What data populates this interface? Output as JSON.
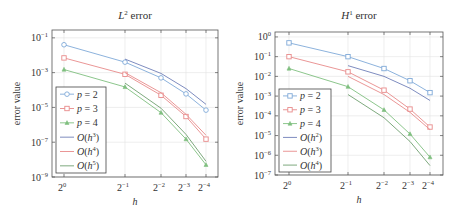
{
  "chart_data": [
    {
      "type": "line",
      "title": "L² error",
      "title_main": "L",
      "title_sup": "2",
      "title_rest": " error",
      "xlabel": "h",
      "ylabel": "error value",
      "xscale": "log2",
      "yscale": "log10",
      "x": [
        1,
        0.5,
        0.25,
        0.125,
        0.0625
      ],
      "x_tick_labels": [
        "2^0",
        "2^-1",
        "2^-2",
        "2^-3",
        "2^-4"
      ],
      "x_tick_exps": [
        "0",
        "−1",
        "−2",
        "−3",
        "−4"
      ],
      "y_tick_exps": [
        "−1",
        "−3",
        "−5",
        "−7",
        "−9"
      ],
      "y_ticks": [
        -1,
        -3,
        -5,
        -7,
        -9
      ],
      "ylim_log10": [
        -9,
        -0.55
      ],
      "grid": true,
      "legend_position": "lower left",
      "series": [
        {
          "name": "p = 2",
          "key": "p",
          "num": "2",
          "color": "#7fa9d8",
          "marker": "circle",
          "x": [
            1,
            0.5,
            0.25,
            0.125,
            0.0625
          ],
          "values": [
            0.04,
            0.004,
            0.0005,
            6e-05,
            7e-06
          ]
        },
        {
          "name": "p = 3",
          "key": "p",
          "num": "3",
          "color": "#e88a8a",
          "marker": "square",
          "x": [
            1,
            0.5,
            0.25,
            0.125,
            0.0625
          ],
          "values": [
            0.007,
            0.0008,
            5e-05,
            3e-06,
            1.5e-07
          ]
        },
        {
          "name": "p = 4",
          "key": "p",
          "num": "4",
          "color": "#7fbf7f",
          "marker": "triangle",
          "x": [
            1,
            0.5,
            0.25,
            0.125,
            0.0625
          ],
          "values": [
            0.0015,
            0.00015,
            5e-06,
            1.5e-07,
            5e-09
          ]
        },
        {
          "name": "O(h^3)",
          "key": "O",
          "num": "3",
          "color": "#6f7fb8",
          "marker": "none",
          "x": [
            0.5,
            0.25,
            0.125,
            0.0625
          ],
          "values": [
            0.006,
            0.0009,
            0.00012,
            1.5e-05
          ]
        },
        {
          "name": "O(h^4)",
          "key": "O",
          "num": "4",
          "color": "#e88a8a",
          "marker": "none",
          "x": [
            0.5,
            0.25,
            0.125,
            0.0625
          ],
          "values": [
            0.001,
            7e-05,
            4e-06,
            2.5e-07
          ]
        },
        {
          "name": "O(h^5)",
          "key": "O",
          "num": "5",
          "color": "#6f9f6f",
          "marker": "none",
          "x": [
            0.5,
            0.25,
            0.125,
            0.0625
          ],
          "values": [
            0.00025,
            9e-06,
            2.8e-07,
            8e-09
          ]
        }
      ]
    },
    {
      "type": "line",
      "title": "H¹ error",
      "title_main": "H",
      "title_sup": "1",
      "title_rest": " error",
      "xlabel": "h",
      "ylabel": "error value",
      "xscale": "log2",
      "yscale": "log10",
      "x": [
        1,
        0.5,
        0.25,
        0.125,
        0.0625
      ],
      "x_tick_labels": [
        "2^0",
        "2^-1",
        "2^-2",
        "2^-3",
        "2^-4"
      ],
      "x_tick_exps": [
        "0",
        "−1",
        "−2",
        "−3",
        "−4"
      ],
      "y_tick_exps": [
        "0",
        "−1",
        "−2",
        "−3",
        "−4",
        "−5",
        "−6",
        "−7"
      ],
      "y_ticks": [
        0,
        -1,
        -2,
        -3,
        -4,
        -5,
        -6,
        -7
      ],
      "ylim_log10": [
        -7,
        0.25
      ],
      "grid": true,
      "legend_position": "lower left",
      "series": [
        {
          "name": "p = 2",
          "key": "p",
          "num": "2",
          "color": "#7fa9d8",
          "marker": "square",
          "x": [
            1,
            0.5,
            0.25,
            0.125,
            0.0625
          ],
          "values": [
            0.5,
            0.1,
            0.025,
            0.006,
            0.0015
          ]
        },
        {
          "name": "p = 3",
          "key": "p",
          "num": "3",
          "color": "#e88a8a",
          "marker": "square",
          "x": [
            1,
            0.5,
            0.25,
            0.125,
            0.0625
          ],
          "values": [
            0.1,
            0.017,
            0.002,
            0.00022,
            2.7e-05
          ]
        },
        {
          "name": "p = 4",
          "key": "p",
          "num": "4",
          "color": "#7fbf7f",
          "marker": "triangle",
          "x": [
            1,
            0.5,
            0.25,
            0.125,
            0.0625
          ],
          "values": [
            0.025,
            0.003,
            0.0002,
            1.2e-05,
            8e-07
          ]
        },
        {
          "name": "O(h^2)",
          "key": "O",
          "num": "2",
          "color": "#6f7fb8",
          "marker": "none",
          "x": [
            0.5,
            0.25,
            0.125,
            0.0625
          ],
          "values": [
            0.035,
            0.01,
            0.0025,
            0.0006
          ]
        },
        {
          "name": "O(h^3)",
          "key": "O",
          "num": "3",
          "color": "#e88a8a",
          "marker": "none",
          "x": [
            0.5,
            0.25,
            0.125,
            0.0625
          ],
          "values": [
            0.01,
            0.0012,
            0.00015,
            2e-05
          ]
        },
        {
          "name": "O(h^4)",
          "key": "O",
          "num": "4",
          "color": "#6f9f6f",
          "marker": "none",
          "x": [
            0.5,
            0.25,
            0.125,
            0.0625
          ],
          "values": [
            0.0012,
            8e-05,
            5e-06,
            3e-07
          ]
        }
      ]
    }
  ],
  "layout": [
    {
      "frame": {
        "x0": 52,
        "x1": 218,
        "y0": 30,
        "y1": 177
      },
      "xpix": [
        64,
        125,
        161,
        186,
        206
      ],
      "ytop_log": -0.55,
      "ybot_log": -9,
      "legend": {
        "x": 56,
        "y": 87,
        "w": 50,
        "h": 86
      }
    },
    {
      "frame": {
        "x0": 275,
        "x1": 443,
        "y0": 32,
        "y1": 175
      },
      "xpix": [
        289,
        348,
        384,
        410,
        430
      ],
      "ytop_log": 0.25,
      "ybot_log": -7,
      "legend": {
        "x": 279,
        "y": 89,
        "w": 52,
        "h": 83
      }
    }
  ]
}
